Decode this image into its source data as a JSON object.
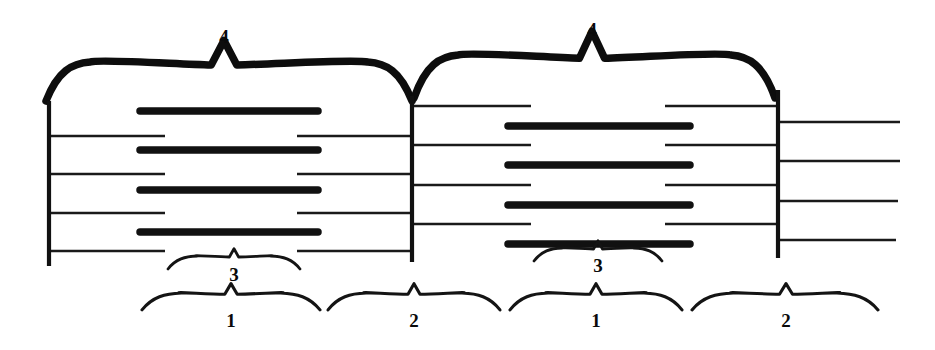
{
  "figure": {
    "background_color": "#ffffff",
    "ink_color": "#111111",
    "width": 935,
    "height": 350
  },
  "labels": {
    "band_1": "1",
    "band_2": "2",
    "band_3": "3",
    "band_4": "4"
  },
  "annotations": {
    "top_braces": [
      {
        "label": "4",
        "label_x": 224,
        "label_y": 43,
        "x_start": 46,
        "x_end": 412,
        "apex_x": 224,
        "y_top": 62,
        "y_bottom": 92
      },
      {
        "label": "4",
        "label_x": 592,
        "label_y": 36,
        "x_start": 414,
        "x_end": 775,
        "apex_x": 592,
        "y_top": 55,
        "y_bottom": 88
      }
    ],
    "mid_braces": [
      {
        "label": "3",
        "label_x": 234,
        "label_y": 281,
        "x_start": 168,
        "x_end": 300,
        "apex_x": 234,
        "y_top": 256,
        "y_bottom": 266
      },
      {
        "label": "3",
        "label_x": 598,
        "label_y": 272,
        "x_start": 534,
        "x_end": 662,
        "apex_x": 598,
        "y_top": 248,
        "y_bottom": 258
      }
    ],
    "bottom_braces": [
      {
        "label": "1",
        "label_x": 231,
        "label_y": 327,
        "x_start": 142,
        "x_end": 320,
        "apex_x": 231,
        "y_top": 293,
        "y_bottom": 306
      },
      {
        "label": "2",
        "label_x": 414,
        "label_y": 327,
        "x_start": 328,
        "x_end": 500,
        "apex_x": 414,
        "y_top": 293,
        "y_bottom": 306
      },
      {
        "label": "1",
        "label_x": 596,
        "label_y": 327,
        "x_start": 510,
        "x_end": 682,
        "apex_x": 596,
        "y_top": 293,
        "y_bottom": 306
      },
      {
        "label": "2",
        "label_x": 786,
        "label_y": 327,
        "x_start": 692,
        "x_end": 878,
        "apex_x": 786,
        "y_top": 293,
        "y_bottom": 306
      }
    ]
  },
  "z_lines": [
    {
      "name": "z-line-left",
      "x": 49,
      "y_top": 101,
      "y_bottom": 266
    },
    {
      "name": "z-line-middle",
      "x": 412,
      "y_top": 96,
      "y_bottom": 262
    },
    {
      "name": "z-line-right",
      "x": 778,
      "y_top": 90,
      "y_bottom": 258
    }
  ],
  "thick_filaments": [
    {
      "unit": "left",
      "x_start": 140,
      "x_end": 318,
      "y": 111
    },
    {
      "unit": "left",
      "x_start": 140,
      "x_end": 318,
      "y": 150
    },
    {
      "unit": "left",
      "x_start": 140,
      "x_end": 318,
      "y": 190
    },
    {
      "unit": "left",
      "x_start": 140,
      "x_end": 318,
      "y": 232
    },
    {
      "unit": "right",
      "x_start": 508,
      "x_end": 690,
      "y": 126
    },
    {
      "unit": "right",
      "x_start": 508,
      "x_end": 690,
      "y": 165
    },
    {
      "unit": "right",
      "x_start": 508,
      "x_end": 690,
      "y": 205
    },
    {
      "unit": "right",
      "x_start": 508,
      "x_end": 690,
      "y": 244
    }
  ],
  "thin_filaments": [
    {
      "unit": "left",
      "anchor": "z-line-left",
      "x_start": 49,
      "x_end": 165,
      "y": 136
    },
    {
      "unit": "left",
      "anchor": "z-line-left",
      "x_start": 49,
      "x_end": 165,
      "y": 174
    },
    {
      "unit": "left",
      "anchor": "z-line-left",
      "x_start": 49,
      "x_end": 165,
      "y": 213
    },
    {
      "unit": "left",
      "anchor": "z-line-left",
      "x_start": 49,
      "x_end": 165,
      "y": 251
    },
    {
      "unit": "left",
      "anchor": "z-line-middle",
      "x_start": 297,
      "x_end": 412,
      "y": 136
    },
    {
      "unit": "left",
      "anchor": "z-line-middle",
      "x_start": 297,
      "x_end": 412,
      "y": 174
    },
    {
      "unit": "left",
      "anchor": "z-line-middle",
      "x_start": 297,
      "x_end": 412,
      "y": 213
    },
    {
      "unit": "left",
      "anchor": "z-line-middle",
      "x_start": 297,
      "x_end": 412,
      "y": 251
    },
    {
      "unit": "right",
      "anchor": "z-line-middle",
      "x_start": 412,
      "x_end": 531,
      "y": 106
    },
    {
      "unit": "right",
      "anchor": "z-line-middle",
      "x_start": 412,
      "x_end": 531,
      "y": 145
    },
    {
      "unit": "right",
      "anchor": "z-line-middle",
      "x_start": 412,
      "x_end": 531,
      "y": 185
    },
    {
      "unit": "right",
      "anchor": "z-line-middle",
      "x_start": 412,
      "x_end": 531,
      "y": 224
    },
    {
      "unit": "right",
      "anchor": "z-line-right",
      "x_start": 665,
      "x_end": 778,
      "y": 106
    },
    {
      "unit": "right",
      "anchor": "z-line-right",
      "x_start": 665,
      "x_end": 778,
      "y": 145
    },
    {
      "unit": "right",
      "anchor": "z-line-right",
      "x_start": 665,
      "x_end": 778,
      "y": 185
    },
    {
      "unit": "right",
      "anchor": "z-line-right",
      "x_start": 665,
      "x_end": 778,
      "y": 224
    },
    {
      "unit": "tail",
      "anchor": "z-line-right",
      "x_start": 778,
      "x_end": 900,
      "y": 122
    },
    {
      "unit": "tail",
      "anchor": "z-line-right",
      "x_start": 778,
      "x_end": 900,
      "y": 161
    },
    {
      "unit": "tail",
      "anchor": "z-line-right",
      "x_start": 778,
      "x_end": 898,
      "y": 201
    },
    {
      "unit": "tail",
      "anchor": "z-line-right",
      "x_start": 778,
      "x_end": 896,
      "y": 240
    }
  ]
}
